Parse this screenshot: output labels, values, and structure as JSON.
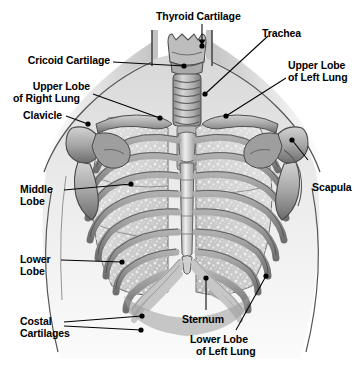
{
  "figure": {
    "background_color": "#ffffff",
    "ink_color": "#000000",
    "palette": {
      "skin_light": "#e8e8e8",
      "skin_mid": "#bcbcbc",
      "skin_dark": "#8f8f8f",
      "lung_fill": "#d9d9d9",
      "lung_speckle": "#f2f2f2",
      "rib_fill": "#9a9a9a",
      "rib_edge": "#5a5a5a",
      "bone_light": "#cfcfcf",
      "bone_dark": "#757575",
      "cartilage": "#b4b4b4",
      "outline": "#3a3a3a"
    }
  },
  "labels": [
    {
      "id": "thyroid-cartilage",
      "text": "Thyroid Cartilage",
      "lines": [
        "Thyroid Cartilage"
      ],
      "marker": "arrow"
    },
    {
      "id": "trachea",
      "text": "Trachea",
      "lines": [
        "Trachea"
      ],
      "marker": "dot"
    },
    {
      "id": "cricoid-cartilage",
      "text": "Cricoid Cartilage",
      "lines": [
        "Cricoid Cartilage"
      ],
      "marker": "dot"
    },
    {
      "id": "upper-lobe-right-lung",
      "text": "Upper Lobe of Right Lung",
      "lines": [
        "Upper Lobe",
        "of Right Lung"
      ],
      "marker": "dot"
    },
    {
      "id": "clavicle",
      "text": "Clavicle",
      "lines": [
        "Clavicle"
      ],
      "marker": "dot"
    },
    {
      "id": "upper-lobe-left-lung",
      "text": "Upper Lobe of Left Lung",
      "lines": [
        "Upper Lobe",
        "of Left Lung"
      ],
      "marker": "dot"
    },
    {
      "id": "scapula",
      "text": "Scapula",
      "lines": [
        "Scapula"
      ],
      "marker": "dot"
    },
    {
      "id": "middle-lobe",
      "text": "Middle Lobe",
      "lines": [
        "Middle",
        "Lobe"
      ],
      "marker": "dot"
    },
    {
      "id": "lower-lobe",
      "text": "Lower Lobe",
      "lines": [
        "Lower",
        "Lobe"
      ],
      "marker": "dot"
    },
    {
      "id": "costal-cartilages",
      "text": "Costal Cartilages",
      "lines": [
        "Costal",
        "Cartilages"
      ],
      "marker": "dot"
    },
    {
      "id": "sternum",
      "text": "Sternum",
      "lines": [
        "Sternum"
      ],
      "marker": "dot"
    },
    {
      "id": "lower-lobe-left-lung",
      "text": "Lower Lobe of Left Lung",
      "lines": [
        "Lower Lobe",
        "of Left Lung"
      ],
      "marker": "dot"
    }
  ],
  "text": {
    "thyroid_cartilage": "Thyroid Cartilage",
    "trachea": "Trachea",
    "cricoid_cartilage": "Cricoid Cartilage",
    "upper_lobe_right_1": "Upper Lobe",
    "upper_lobe_right_2": "of Right Lung",
    "clavicle": "Clavicle",
    "upper_lobe_left_1": "Upper Lobe",
    "upper_lobe_left_2": "of Left Lung",
    "scapula": "Scapula",
    "middle_lobe_1": "Middle",
    "middle_lobe_2": "Lobe",
    "lower_lobe_1": "Lower",
    "lower_lobe_2": "Lobe",
    "costal_cartilages_1": "Costal",
    "costal_cartilages_2": "Cartilages",
    "sternum": "Sternum",
    "lower_lobe_left_1": "Lower Lobe",
    "lower_lobe_left_2": "of Left Lung"
  }
}
